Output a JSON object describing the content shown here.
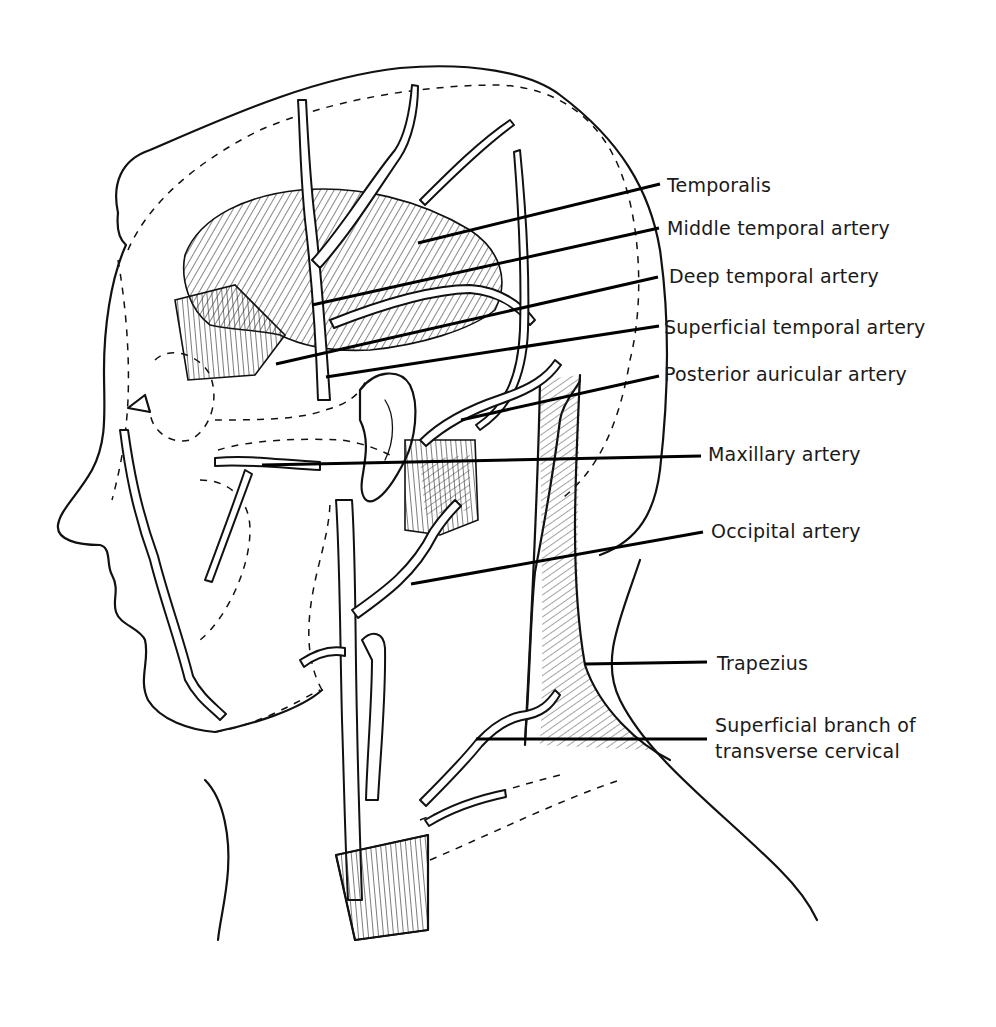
{
  "figure": {
    "colors": {
      "ink": "#111111",
      "background": "#ffffff"
    }
  },
  "labels": [
    {
      "id": "temporalis",
      "text": "Temporalis",
      "x": 667,
      "y": 172,
      "line": [
        418,
        243,
        660,
        184
      ]
    },
    {
      "id": "middle-temporal-artery",
      "text": "Middle temporal artery",
      "x": 667,
      "y": 215,
      "line": [
        312,
        305,
        659,
        228
      ]
    },
    {
      "id": "deep-temporal-artery",
      "text": "Deep temporal artery",
      "x": 669,
      "y": 263,
      "line": [
        276,
        364,
        658,
        277
      ]
    },
    {
      "id": "superficial-temporal-artery",
      "text": "Superficial temporal artery",
      "x": 664,
      "y": 314,
      "line": [
        326,
        377,
        659,
        326
      ]
    },
    {
      "id": "posterior-auricular-artery",
      "text": "Posterior auricular artery",
      "x": 664,
      "y": 361,
      "line": [
        461,
        420,
        659,
        376
      ]
    },
    {
      "id": "maxillary-artery",
      "text": "Maxillary artery",
      "x": 708,
      "y": 441,
      "line": [
        262,
        465,
        701,
        456
      ]
    },
    {
      "id": "occipital-artery",
      "text": "Occipital artery",
      "x": 711,
      "y": 518,
      "line": [
        411,
        584,
        703,
        532
      ]
    },
    {
      "id": "trapezius",
      "text": "Trapezius",
      "x": 717,
      "y": 650,
      "line": [
        585,
        664,
        707,
        662
      ]
    },
    {
      "id": "superficial-branch-transverse-cervical",
      "text": "Superficial branch of",
      "text2": "transverse cervical",
      "x": 715,
      "y": 715,
      "line": [
        476,
        739,
        707,
        739
      ]
    }
  ]
}
